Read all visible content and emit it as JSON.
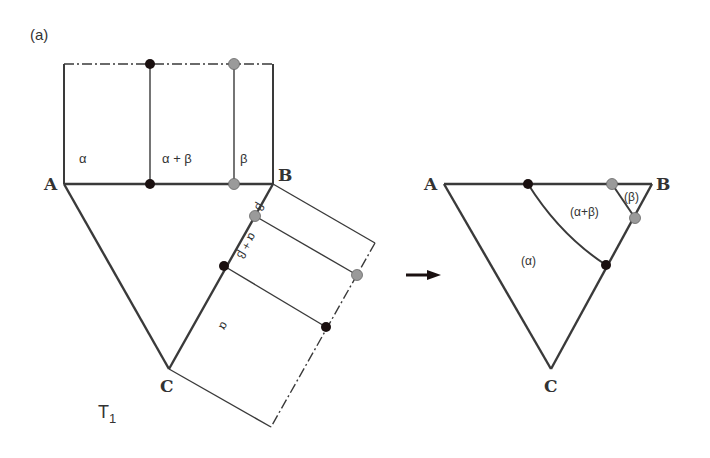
{
  "figure": {
    "panel_label": "(a)",
    "projection_label": "T",
    "projection_subscript": "1",
    "colors": {
      "line": "#3a3a3a",
      "dot_black": "#1a1010",
      "dot_gray": "#9a9a9a"
    }
  },
  "left_diagram": {
    "vertices": {
      "A": "A",
      "B": "B",
      "C": "C"
    },
    "top_section": {
      "regions": [
        "α",
        "α + β",
        "β"
      ]
    },
    "right_section": {
      "regions": [
        "α",
        "α + β",
        "β"
      ]
    }
  },
  "right_diagram": {
    "vertices": {
      "A": "A",
      "B": "B",
      "C": "C"
    },
    "regions": [
      "(α)",
      "(α+β)",
      "(β)"
    ]
  }
}
